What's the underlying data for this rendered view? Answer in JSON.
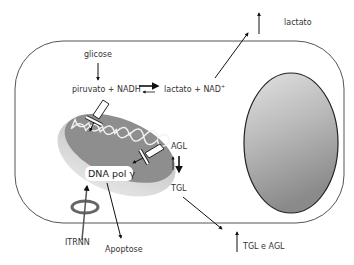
{
  "diagram": {
    "type": "cell-metabolism",
    "labels": {
      "glicose": "glicose",
      "piruvato_nadh": "piruvato + NADH",
      "lactato_nad": "lactato + NAD",
      "nad_sup": "+",
      "lactato_out": "lactato",
      "dna_pol": "DNA pol γ",
      "agl": "AGL",
      "tgl": "TGL",
      "itrnn": "ITRNN",
      "apoptose": "Apoptose",
      "tgl_e_agl": "TGL e AGL"
    },
    "colors": {
      "cell_outline": "#555555",
      "nucleus_fill_top": "#d8d8d8",
      "nucleus_fill_bottom": "#8a8a8a",
      "mito_outer": "#c8c8c8",
      "mito_inner": "#8c8c8c",
      "arrow": "#111111"
    },
    "nodes": [
      {
        "id": "cell",
        "shape": "rounded-rect"
      },
      {
        "id": "nucleus",
        "shape": "ellipse"
      },
      {
        "id": "mitochondrion",
        "shape": "ellipse"
      },
      {
        "id": "itrnn-ring",
        "shape": "ring"
      }
    ],
    "edges": [
      {
        "from": "glicose",
        "to": "piruvato + NADH"
      },
      {
        "from": "piruvato + NADH",
        "to": "lactato + NAD+",
        "type": "reversible-favored-forward"
      },
      {
        "from": "lactato + NAD+",
        "to": "lactato (out)"
      },
      {
        "from": "TGL",
        "to": "TGL e AGL (out)"
      },
      {
        "from": "AGL",
        "to": "TGL",
        "type": "reversible-favored-down"
      },
      {
        "from": "DNA pol γ",
        "to": "Apoptose"
      },
      {
        "from": "ITRNN",
        "to": "mitochondrion"
      },
      {
        "from": "inhibitor",
        "to": "mitochondrion",
        "type": "inhibition"
      },
      {
        "from": "inhibitor",
        "to": "DNA pol γ",
        "type": "inhibition"
      }
    ]
  }
}
